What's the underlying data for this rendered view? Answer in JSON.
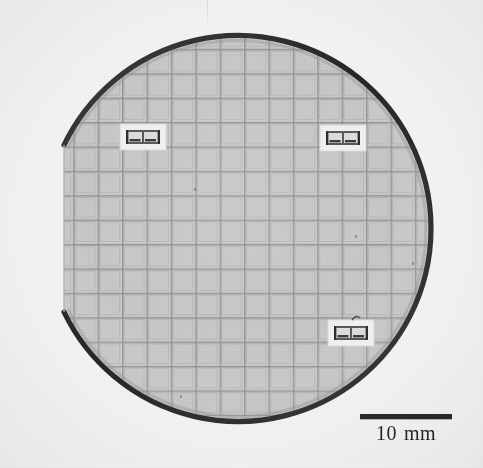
{
  "figure": {
    "kind": "micrograph-photograph",
    "width_px": 483,
    "height_px": 468,
    "background_color": "#f4f4f3"
  },
  "wafer": {
    "center_x": 243,
    "center_y": 218,
    "radius": 193,
    "surface_color": "#c6c6c4",
    "edge_color": "#2f2f2f",
    "edge_width": 5,
    "flat": {
      "label": "primary-flat",
      "x": 64,
      "y_start": 145,
      "y_end": 312
    }
  },
  "die_grid": {
    "pitch_px": 24.4,
    "columns": 16,
    "rows": 17,
    "origin_x": 64,
    "origin_y": 27,
    "scribe_color": "#8e8e8c",
    "die_fill": "#c9c9c7"
  },
  "insets": [
    {
      "name": "inset-top-left",
      "x": 120,
      "y": 124,
      "w": 46,
      "h": 26
    },
    {
      "name": "inset-top-right",
      "x": 320,
      "y": 125,
      "w": 46,
      "h": 26
    },
    {
      "name": "inset-bottom-right",
      "x": 328,
      "y": 320,
      "w": 46,
      "h": 26
    }
  ],
  "scalebar": {
    "length_px": 92,
    "value": "10",
    "unit": "mm",
    "label": "10 mm",
    "color": "#2a2a2a"
  },
  "annotations": {
    "scan_artifact": "faint vertical line near top center",
    "specks": [
      {
        "x": 194,
        "y": 188
      },
      {
        "x": 355,
        "y": 235
      },
      {
        "x": 180,
        "y": 395
      },
      {
        "x": 412,
        "y": 262
      }
    ]
  }
}
